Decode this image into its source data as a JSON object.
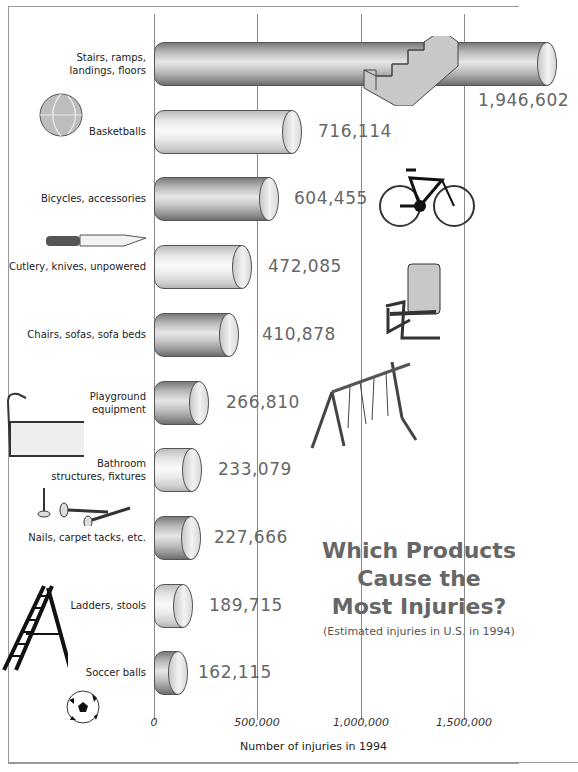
{
  "chart_data": {
    "type": "bar",
    "orientation": "horizontal",
    "title": "Which Products Cause the Most Injuries?",
    "subtitle": "(Estimated injuries in U.S. in 1994)",
    "xlabel": "Number of injuries in 1994",
    "ylabel": "",
    "xlim": [
      0,
      1946602
    ],
    "xticks": [
      "0",
      "500,000",
      "1,000,000",
      "1,500,000"
    ],
    "grid": true,
    "categories": [
      "Stairs, ramps, landings, floors",
      "Basketballs",
      "Bicycles, accessories",
      "Cutlery, knives, unpowered",
      "Chairs, sofas, sofa beds",
      "Playground equipment",
      "Bathroom structures, fixtures",
      "Nails, carpet tacks, etc.",
      "Ladders, stools",
      "Soccer balls"
    ],
    "values": [
      1946602,
      716114,
      604455,
      472085,
      410878,
      266810,
      233079,
      227666,
      189715,
      162115
    ],
    "value_labels": [
      "1,946,602",
      "716,114",
      "604,455",
      "472,085",
      "410,878",
      "266,810",
      "233,079",
      "227,666",
      "189,715",
      "162,115"
    ]
  },
  "title_lines": [
    "Which Products",
    "Cause the",
    "Most Injuries?"
  ],
  "subtitle": "(Estimated injuries in U.S. in 1994)",
  "xaxis": {
    "label": "Number of injuries in 1994",
    "ticks": [
      "0",
      "500,000",
      "1,000,000",
      "1,500,000"
    ]
  },
  "rows": [
    {
      "label_lines": [
        "Stairs, ramps,",
        "landings, floors"
      ],
      "value": "1,946,602",
      "icon": "stairs-icon",
      "shade": "dark"
    },
    {
      "label_lines": [
        "Basketballs"
      ],
      "value": "716,114",
      "icon": "basketball-icon",
      "shade": "light"
    },
    {
      "label_lines": [
        "Bicycles, accessories"
      ],
      "value": "604,455",
      "icon": "bicycle-icon",
      "shade": "dark"
    },
    {
      "label_lines": [
        "Cutlery, knives, unpowered"
      ],
      "value": "472,085",
      "icon": "knife-icon",
      "shade": "light"
    },
    {
      "label_lines": [
        "Chairs, sofas, sofa beds"
      ],
      "value": "410,878",
      "icon": "chair-icon",
      "shade": "dark"
    },
    {
      "label_lines": [
        "Playground",
        "equipment"
      ],
      "value": "266,810",
      "icon": "swing-set-icon",
      "shade": "dark"
    },
    {
      "label_lines": [
        "Bathroom",
        "structures, fixtures"
      ],
      "value": "233,079",
      "icon": "bathtub-icon",
      "shade": "light"
    },
    {
      "label_lines": [
        "Nails, carpet tacks, etc."
      ],
      "value": "227,666",
      "icon": "nails-icon",
      "shade": "dark"
    },
    {
      "label_lines": [
        "Ladders, stools"
      ],
      "value": "189,715",
      "icon": "ladder-icon",
      "shade": "light"
    },
    {
      "label_lines": [
        "Soccer balls"
      ],
      "value": "162,115",
      "icon": "soccer-ball-icon",
      "shade": "dark"
    }
  ]
}
